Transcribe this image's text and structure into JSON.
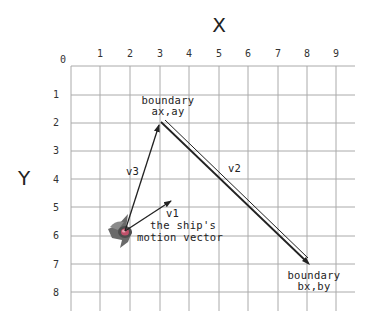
{
  "diagram": {
    "x_axis_title": "X",
    "y_axis_title": "Y",
    "origin_label": "0",
    "x_ticks": [
      "1",
      "2",
      "3",
      "4",
      "5",
      "6",
      "7",
      "8",
      "9"
    ],
    "y_ticks": [
      "1",
      "2",
      "3",
      "4",
      "5",
      "6",
      "7",
      "8"
    ],
    "vectors": {
      "v1": {
        "label": "v1",
        "description_line1": "the ship's",
        "description_line2": "motion vector"
      },
      "v2": {
        "label": "v2"
      },
      "v3": {
        "label": "v3"
      }
    },
    "boundary_a": {
      "line1": "boundary",
      "line2": "ax,ay"
    },
    "boundary_b": {
      "line1": "boundary",
      "line2": "bx,by"
    },
    "colors": {
      "grid": "#aaaaaa",
      "vector": "#222222",
      "ship_body": "#6a6a6a",
      "ship_accent": "#c0506a"
    }
  }
}
